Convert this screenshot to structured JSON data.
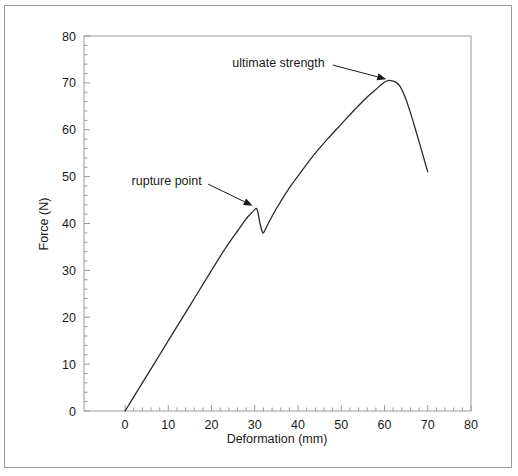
{
  "chart_data": {
    "type": "line",
    "title": "",
    "xlabel": "Deformation (mm)",
    "ylabel": "Force (N)",
    "xlim": [
      -9.5,
      80
    ],
    "ylim": [
      0,
      80
    ],
    "x_ticks": [
      0,
      10,
      20,
      30,
      40,
      50,
      60,
      70,
      80
    ],
    "y_ticks": [
      0,
      10,
      20,
      30,
      40,
      50,
      60,
      70,
      80
    ],
    "x_tick_labels": [
      "0",
      "10",
      "20",
      "30",
      "40",
      "50",
      "60",
      "70",
      "80"
    ],
    "y_tick_labels": [
      "0",
      "10",
      "20",
      "30",
      "40",
      "50",
      "60",
      "70",
      "80"
    ],
    "x_minor_tick_step": 2,
    "y_minor_tick_step": 2,
    "grid": false,
    "legend": false,
    "series": [
      {
        "name": "force-deformation",
        "color": "#2b2b2b",
        "x": [
          0,
          2,
          4,
          6,
          8,
          10,
          12,
          14,
          16,
          18,
          20,
          22,
          24,
          26,
          28,
          29,
          29.8,
          30.4,
          30.8,
          31.2,
          31.6,
          32.0,
          33,
          35,
          38,
          41,
          44,
          47,
          50,
          53,
          56,
          58,
          59.5,
          60.5,
          61.5,
          62.5,
          63.3,
          64,
          65,
          66,
          67,
          68,
          69,
          70
        ],
        "y": [
          0,
          3.0,
          6.0,
          9.0,
          12.0,
          15.0,
          18.0,
          21.0,
          24.0,
          27.0,
          30.0,
          33.0,
          35.8,
          38.4,
          41.0,
          42.0,
          42.8,
          43.2,
          42.0,
          40.0,
          38.6,
          38.0,
          39.8,
          43.2,
          47.6,
          51.4,
          55.0,
          58.2,
          61.2,
          64.2,
          67.0,
          68.6,
          69.8,
          70.4,
          70.5,
          70.2,
          69.6,
          68.6,
          66.4,
          63.6,
          60.6,
          57.4,
          54.2,
          51.0
        ]
      }
    ],
    "annotations": [
      {
        "id": "rupture-point",
        "text": "rupture point",
        "text_x": 1.5,
        "text_y": 49.2,
        "arrow_from_x": 19.2,
        "arrow_from_y": 48.4,
        "arrow_to_x": 29.5,
        "arrow_to_y": 43.8
      },
      {
        "id": "ultimate-strength",
        "text": "ultimate strength",
        "text_x": 24.8,
        "text_y": 74.4,
        "arrow_from_x": 48.0,
        "arrow_from_y": 73.8,
        "arrow_to_x": 60.4,
        "arrow_to_y": 70.8
      }
    ]
  },
  "style": {
    "frame_color": "#9a9a9a",
    "curve_color": "#2b2b2b",
    "text_color": "#1a1a1a",
    "background": "#ffffff",
    "border_color": "#9a9a9a"
  }
}
